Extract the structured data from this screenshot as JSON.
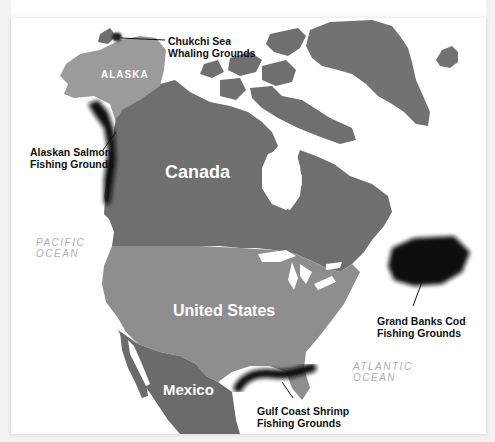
{
  "map": {
    "countries": {
      "alaska": "ALASKA",
      "canada": "Canada",
      "united_states": "United States",
      "mexico": "Mexico"
    },
    "oceans": {
      "pacific_line1": "PACIFIC",
      "pacific_line2": "OCEAN",
      "atlantic_line1": "ATLANTIC",
      "atlantic_line2": "OCEAN"
    },
    "fishing_grounds": [
      {
        "line1": "Chukchi Sea",
        "line2": "Whaling Grounds"
      },
      {
        "line1": "Alaskan Salmon",
        "line2": "Fishing Grounds"
      },
      {
        "line1": "Grand Banks Cod",
        "line2": "Fishing Grounds"
      },
      {
        "line1": "Gulf Coast Shrimp",
        "line2": "Fishing Grounds"
      }
    ],
    "colors": {
      "canada": "#6f6f6f",
      "united_states": "#8e8e8e",
      "alaska": "#9b9b9b",
      "mexico": "#6b6b6b",
      "greenland": "#727272",
      "fishing_zone": "#111111",
      "ocean_label": "#b0b0b0"
    }
  }
}
